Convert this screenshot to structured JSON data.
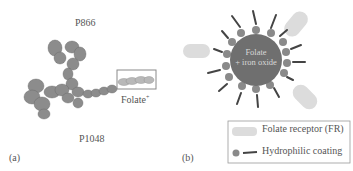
{
  "panel_a": {
    "label_top": "P866",
    "label_bottom": "P1048",
    "folate_label": "Folate",
    "folate_superscript": "+",
    "panel_label": "(a)"
  },
  "panel_b": {
    "core_line1": "Folate",
    "core_line2": "+ iron oxide",
    "panel_label": "(b)",
    "legend": [
      {
        "icon": "folate-receptor-shape",
        "label": "Folate receptor (FR)"
      },
      {
        "icon": "hydrophilic-coating-shape",
        "label": "Hydrophilic coating"
      }
    ]
  },
  "colors": {
    "core": "#6f6f6f",
    "bead": "#8a8a8a",
    "receptor": "#dcdcdc",
    "protein": "#8c8c8c",
    "box": "#8a8a8a"
  }
}
